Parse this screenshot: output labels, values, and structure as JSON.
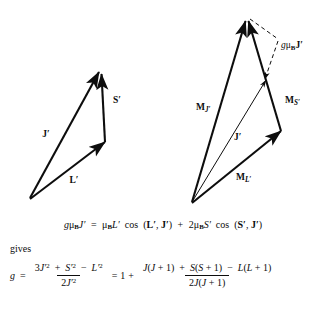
{
  "figure": {
    "left_diagram": {
      "name": "angular-momentum-vector-triangle",
      "vectors": [
        {
          "id": "J-prime",
          "label": "J",
          "prime": "′",
          "bold": true,
          "x1": 30,
          "y1": 198,
          "x2": 99,
          "y2": 72,
          "label_x": 48,
          "label_y": 134
        },
        {
          "id": "S-prime",
          "label": "S",
          "prime": "′",
          "bold": true,
          "x1": 105,
          "y1": 142,
          "x2": 101,
          "y2": 73,
          "label_x": 114,
          "label_y": 100
        },
        {
          "id": "L-prime",
          "label": "L",
          "prime": "′",
          "bold": true,
          "x1": 30,
          "y1": 199,
          "x2": 105,
          "y2": 142,
          "label_x": 73,
          "label_y": 180
        }
      ]
    },
    "right_diagram": {
      "name": "magnetic-moment-vector-diagram",
      "vectors": [
        {
          "id": "M-J-prime",
          "label": "M",
          "sub": "J′",
          "bold": true,
          "x1": 192,
          "y1": 202,
          "x2": 245,
          "y2": 20,
          "label_x": 196,
          "label_y": 107
        },
        {
          "id": "M-S-prime",
          "label": "M",
          "sub": "S′",
          "bold": true,
          "x1": 281,
          "y1": 131,
          "x2": 248,
          "y2": 20,
          "label_x": 285,
          "label_y": 100
        },
        {
          "id": "M-L-prime",
          "label": "M",
          "sub": "L′",
          "bold": true,
          "x1": 192,
          "y1": 203,
          "x2": 281,
          "y2": 131,
          "label_x": 240,
          "label_y": 176
        },
        {
          "id": "J-prime-resultant",
          "label": "J",
          "prime": "′",
          "bold": true,
          "x1": 192,
          "y1": 202,
          "x2": 266,
          "y2": 79,
          "label_x": 237,
          "label_y": 136
        }
      ],
      "projection": {
        "id": "g-mu-B-J-prime",
        "label_g": "g",
        "label_mu": "μ",
        "label_sub": "B",
        "label_J": "J",
        "label_prime": "′",
        "label_x": 281,
        "label_y": 46,
        "dashed_from_apex": {
          "x1": 250,
          "y1": 20,
          "x2": 277,
          "y2": 39
        },
        "dashed_to_J": {
          "x1": 277,
          "y1": 41,
          "x2": 264,
          "y2": 80
        }
      }
    }
  },
  "equation_one": {
    "name": "lande-g-projection-equation",
    "text": "gμʙJ′ = μʙL′ cos (L′, J′) + 2μʙS′ cos (S′, J′)",
    "parts": {
      "g": "g",
      "mu": "μ",
      "sub_B": "B",
      "J": "J",
      "prime": "′",
      "equals": "=",
      "L": "L",
      "cos": "cos",
      "open_paren": "(",
      "comma": ",",
      "close_paren": ")",
      "plus": "+",
      "two": "2",
      "S": "S"
    }
  },
  "gives": {
    "name": "gives-connector",
    "text": "gives"
  },
  "equation_two": {
    "name": "lande-g-factor-equation",
    "lead": "g",
    "equals_first": "=",
    "left_fraction": {
      "numerator": "3J′² + S′² − L′²",
      "denominator": "2J′²",
      "num_parts": {
        "three": "3",
        "J": "J",
        "prime": "′",
        "sup_two": "2",
        "plus": "+",
        "S": "S",
        "minus": "−",
        "L": "L"
      },
      "den_parts": {
        "two": "2",
        "J": "J",
        "prime": "′",
        "sup_two": "2"
      }
    },
    "equals_second": "=",
    "one": "1",
    "plus": "+",
    "right_fraction": {
      "numerator": "J(J + 1) + S(S + 1) − L(L + 1)",
      "denominator": "2J(J + 1)",
      "num_parts": {
        "J": "J",
        "open": "(",
        "plus_one": "+ 1",
        "close": ")",
        "plus": "+",
        "S": "S",
        "minus": "−",
        "L": "L"
      },
      "den_parts": {
        "two": "2",
        "J": "J",
        "open": "(",
        "plus_one": "+ 1",
        "close": ")"
      }
    }
  }
}
